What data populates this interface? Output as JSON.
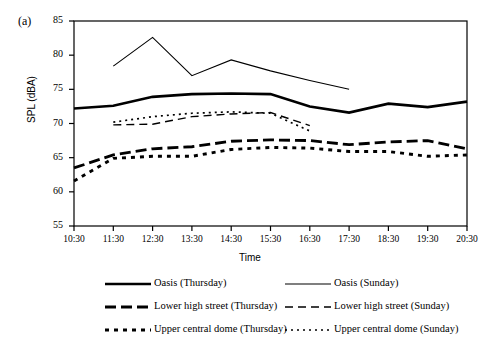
{
  "panel": {
    "label": "(a)"
  },
  "chart_data": {
    "type": "line",
    "title": "",
    "xlabel": "Time",
    "ylabel": "SPL (dBA)",
    "ylim": [
      55,
      85
    ],
    "ytick_step": 5,
    "yticks": [
      55,
      60,
      65,
      70,
      75,
      80,
      85
    ],
    "grid": false,
    "legend_position": "below",
    "categories": [
      "10:30",
      "11:30",
      "12:30",
      "13:30",
      "14:30",
      "15:30",
      "16:30",
      "17:30",
      "18:30",
      "19:30",
      "20:30"
    ],
    "series": [
      {
        "name": "Oasis (Thursday)",
        "style": "solid-thick",
        "x": [
          "10:30",
          "11:30",
          "12:30",
          "13:30",
          "14:30",
          "15:30",
          "16:30",
          "17:30",
          "18:30",
          "19:30",
          "20:30"
        ],
        "values": [
          72.2,
          72.6,
          73.9,
          74.3,
          74.4,
          74.3,
          72.5,
          71.6,
          72.9,
          72.4,
          73.2
        ]
      },
      {
        "name": "Oasis (Sunday)",
        "style": "solid-thin",
        "x": [
          "11:30",
          "12:30",
          "13:30",
          "14:30",
          "15:30",
          "16:30",
          "17:30"
        ],
        "values": [
          78.4,
          82.6,
          77.0,
          79.3,
          77.7,
          76.3,
          75.0
        ]
      },
      {
        "name": "Lower high street (Thursday)",
        "style": "dashed-thick",
        "x": [
          "10:30",
          "11:30",
          "12:30",
          "13:30",
          "14:30",
          "15:30",
          "16:30",
          "17:30",
          "18:30",
          "19:30",
          "20:30"
        ],
        "values": [
          63.5,
          65.4,
          66.3,
          66.6,
          67.4,
          67.6,
          67.5,
          66.9,
          67.3,
          67.5,
          66.3
        ]
      },
      {
        "name": "Lower high street (Sunday)",
        "style": "dashed-thin",
        "x": [
          "11:30",
          "12:30",
          "13:30",
          "14:30",
          "15:30",
          "16:30"
        ],
        "values": [
          69.8,
          69.9,
          71.0,
          71.4,
          71.6,
          69.7
        ]
      },
      {
        "name": "Upper central dome (Thursday)",
        "style": "dotted-thick",
        "x": [
          "10:30",
          "11:30",
          "12:30",
          "13:30",
          "14:30",
          "15:30",
          "16:30",
          "17:30",
          "18:30",
          "19:30",
          "20:30"
        ],
        "values": [
          61.6,
          64.9,
          65.2,
          65.2,
          66.2,
          66.5,
          66.4,
          65.9,
          65.9,
          65.2,
          65.4
        ]
      },
      {
        "name": "Upper central dome (Sunday)",
        "style": "dotted-thin",
        "x": [
          "11:30",
          "12:30",
          "13:30",
          "14:30",
          "15:30",
          "16:30"
        ],
        "values": [
          70.2,
          71.0,
          71.5,
          71.7,
          71.5,
          68.9
        ]
      }
    ]
  },
  "legend": {
    "entries": [
      {
        "label": "Oasis (Thursday)",
        "style": "solid-thick"
      },
      {
        "label": "Oasis (Sunday)",
        "style": "solid-thin"
      },
      {
        "label": "Lower high street (Thursday)",
        "style": "dashed-thick"
      },
      {
        "label": "Lower high street (Sunday)",
        "style": "dashed-thin"
      },
      {
        "label": "Upper central dome (Thursday)",
        "style": "dotted-thick"
      },
      {
        "label": "Upper central dome (Sunday)",
        "style": "dotted-thin"
      }
    ]
  },
  "colors": {
    "ink": "#000000",
    "background": "#ffffff"
  }
}
